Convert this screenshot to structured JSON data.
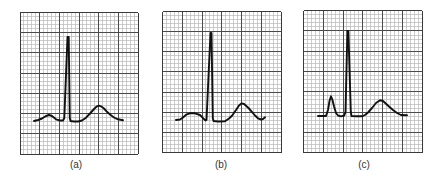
{
  "figure": {
    "width": 440,
    "height": 178,
    "colors": {
      "background": "#ffffff",
      "minor_grid": "#b8b8b8",
      "major_grid": "#4a4a4a",
      "border": "#3a3a3a",
      "trace": "#111111",
      "label": "#333333"
    },
    "grid": {
      "major_cols": 6,
      "major_rows": 7,
      "minor_per_major": 5
    }
  },
  "panels": [
    {
      "id": "a",
      "label": "(a)",
      "label_x": 76,
      "grid_box": {
        "x": 20,
        "y": 12.5,
        "w": 118,
        "h": 141.5
      },
      "trace": [
        [
          34,
          121
        ],
        [
          38,
          120
        ],
        [
          42,
          118.5
        ],
        [
          46,
          116
        ],
        [
          49,
          115
        ],
        [
          52,
          116
        ],
        [
          56,
          119.3
        ],
        [
          60,
          120.5
        ],
        [
          63,
          120.5
        ],
        [
          64.3,
          118
        ],
        [
          67.5,
          37
        ],
        [
          68.7,
          37
        ],
        [
          69.8,
          118
        ],
        [
          70.5,
          121
        ],
        [
          74,
          121.5
        ],
        [
          78,
          121.5
        ],
        [
          82,
          120.5
        ],
        [
          86,
          117.7
        ],
        [
          90,
          113.5
        ],
        [
          94,
          109
        ],
        [
          97,
          106.3
        ],
        [
          99,
          105.7
        ],
        [
          101,
          106.3
        ],
        [
          104,
          108.5
        ],
        [
          107,
          111.8
        ],
        [
          110,
          114.5
        ],
        [
          114,
          117.5
        ],
        [
          118,
          119.3
        ],
        [
          123,
          120.3
        ]
      ]
    },
    {
      "id": "b",
      "label": "(b)",
      "label_x": 221,
      "grid_box": {
        "x": 162.5,
        "y": 11.5,
        "w": 118.5,
        "h": 141
      },
      "trace": [
        [
          176,
          120
        ],
        [
          180,
          119.5
        ],
        [
          183,
          117.5
        ],
        [
          186.7,
          114.3
        ],
        [
          190,
          113.3
        ],
        [
          195,
          113.3
        ],
        [
          200,
          115
        ],
        [
          203.3,
          118.3
        ],
        [
          205.5,
          120.5
        ],
        [
          206.5,
          120
        ],
        [
          210.5,
          33
        ],
        [
          211.5,
          33
        ],
        [
          212.8,
          118
        ],
        [
          213.5,
          121
        ],
        [
          218,
          121.5
        ],
        [
          225,
          121.3
        ],
        [
          229,
          118.5
        ],
        [
          232,
          115.7
        ],
        [
          236,
          110
        ],
        [
          239,
          105.5
        ],
        [
          241.7,
          103.3
        ],
        [
          244,
          104
        ],
        [
          248,
          107.5
        ],
        [
          251.7,
          111.7
        ],
        [
          255,
          115.5
        ],
        [
          258,
          118.3
        ],
        [
          261,
          119.5
        ],
        [
          263,
          119
        ],
        [
          265,
          117.3
        ]
      ]
    },
    {
      "id": "c",
      "label": "(c)",
      "label_x": 364,
      "grid_box": {
        "x": 303.5,
        "y": 10.7,
        "w": 118.5,
        "h": 142
      },
      "trace": [
        [
          318,
          116
        ],
        [
          326,
          116
        ],
        [
          328,
          110
        ],
        [
          329.5,
          101
        ],
        [
          331,
          96.3
        ],
        [
          332.5,
          100
        ],
        [
          334,
          106.3
        ],
        [
          336,
          113
        ],
        [
          338,
          115.5
        ],
        [
          341,
          116.3
        ],
        [
          344.3,
          115.5
        ],
        [
          345.5,
          112
        ],
        [
          347.4,
          31
        ],
        [
          348.4,
          31
        ],
        [
          350.8,
          112
        ],
        [
          351.5,
          116
        ],
        [
          356,
          116.3
        ],
        [
          362,
          116.3
        ],
        [
          365,
          115
        ],
        [
          368,
          112.5
        ],
        [
          372,
          108
        ],
        [
          376,
          103
        ],
        [
          380,
          100.3
        ],
        [
          383,
          101
        ],
        [
          386,
          103.8
        ],
        [
          389,
          106.5
        ],
        [
          393,
          110
        ],
        [
          397,
          113
        ],
        [
          401,
          115
        ],
        [
          407,
          115.3
        ]
      ]
    }
  ]
}
